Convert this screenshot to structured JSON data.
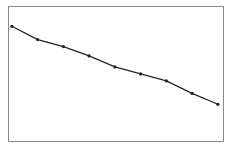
{
  "chart_data": {
    "type": "line",
    "title": "",
    "xlabel": "",
    "ylabel": "",
    "grid": false,
    "legend": null,
    "x": [
      1,
      2,
      3,
      4,
      5,
      6,
      7,
      8,
      9
    ],
    "series": [
      {
        "name": "series-1",
        "color": "#222222",
        "values": [
          100,
          83,
          74,
          62,
          48,
          39,
          30,
          14,
          0
        ]
      }
    ],
    "xlim": [
      0.85,
      9.2
    ],
    "ylim": [
      -47,
      126
    ]
  },
  "frame": {
    "left": 8,
    "top": 6,
    "right": 223,
    "bottom": 141,
    "border_color": "#888888"
  }
}
